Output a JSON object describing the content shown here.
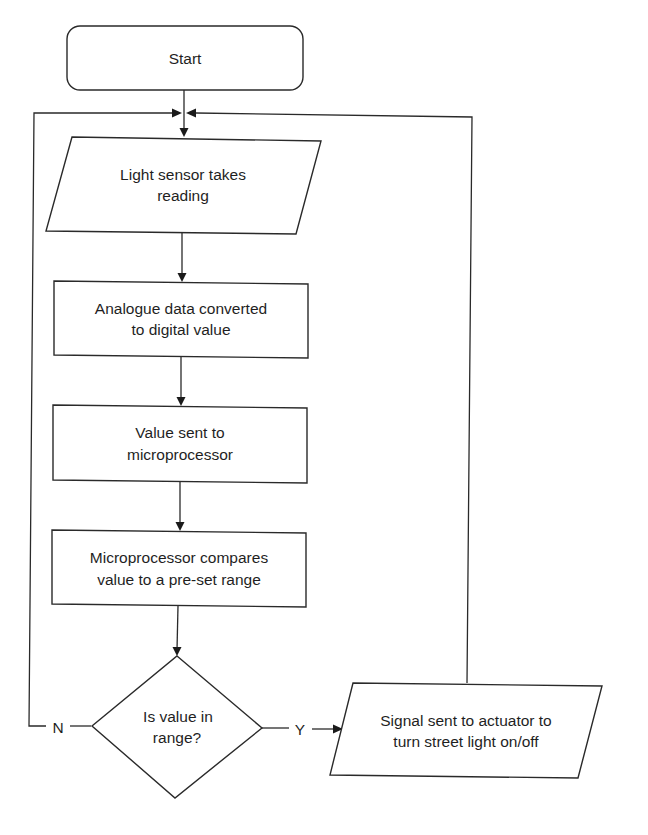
{
  "diagram": {
    "type": "flowchart",
    "colors": {
      "stroke": "#2a2a2a",
      "fill": "#ffffff",
      "text": "#1f1f1f"
    },
    "nodes": {
      "start": {
        "shape": "terminator",
        "label": "Start"
      },
      "read": {
        "shape": "input-output",
        "lines": [
          "Light sensor takes",
          "reading"
        ]
      },
      "convert": {
        "shape": "process",
        "lines": [
          "Analogue data converted",
          "to digital value"
        ]
      },
      "send": {
        "shape": "process",
        "lines": [
          "Value sent to",
          "microprocessor"
        ]
      },
      "compare": {
        "shape": "process",
        "lines": [
          "Microprocessor compares",
          "value to a pre-set range"
        ]
      },
      "decision": {
        "shape": "decision",
        "lines": [
          "Is value in",
          "range?"
        ]
      },
      "signal": {
        "shape": "input-output",
        "lines": [
          "Signal sent to actuator to",
          "turn street light on/off"
        ]
      }
    },
    "branches": {
      "no": "N",
      "yes": "Y"
    },
    "edges": [
      {
        "from": "start",
        "to": "read"
      },
      {
        "from": "read",
        "to": "convert"
      },
      {
        "from": "convert",
        "to": "send"
      },
      {
        "from": "send",
        "to": "compare"
      },
      {
        "from": "compare",
        "to": "decision"
      },
      {
        "from": "decision",
        "to": "signal",
        "label": "Y"
      },
      {
        "from": "decision",
        "to": "read",
        "label": "N"
      },
      {
        "from": "signal",
        "to": "read"
      }
    ]
  }
}
